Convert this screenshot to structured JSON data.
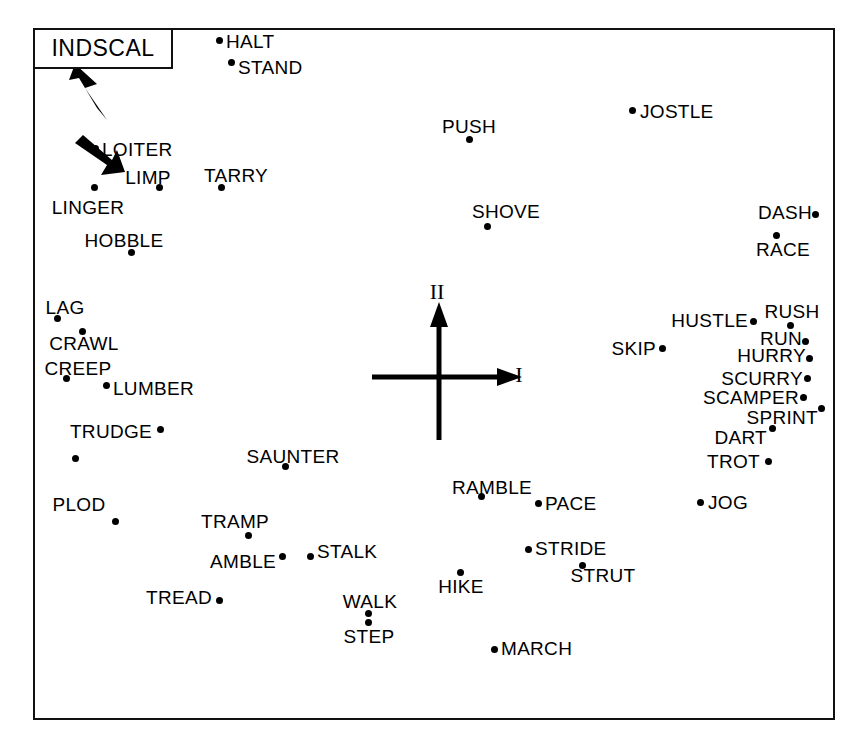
{
  "figure": {
    "method_label": "INDSCAL",
    "frame": {
      "x": 33,
      "y": 28,
      "width": 802,
      "height": 692
    },
    "title_box": {
      "x": 33,
      "y": 28,
      "width": 140,
      "height": 41
    }
  },
  "axes": {
    "origin": {
      "x": 437,
      "y": 375
    },
    "dimension_1_label": "I",
    "dimension_2_label": "II",
    "dimension_1_label_pos": {
      "x": 519,
      "y": 375
    },
    "dimension_2_label_pos": {
      "x": 437,
      "y": 292
    },
    "horizontal": {
      "x1": 370,
      "y1": 375,
      "x2": 508,
      "y2": 375
    },
    "vertical": {
      "x1": 437,
      "y1": 438,
      "x2": 437,
      "y2": 305
    }
  },
  "chart_data": {
    "type": "scatter",
    "title": "INDSCAL",
    "xlabel": "I",
    "ylabel": "II",
    "grid": false,
    "legend": null,
    "note": "Two-dimensional INDSCAL configuration of 41 English locomotion verbs. Coordinates given in screenshot pixel space; axis origin at (437, 375).",
    "points": [
      {
        "label": "HALT",
        "x": 219,
        "y": 40,
        "label_anchor": "left",
        "label_x": 226,
        "label_y": 41
      },
      {
        "label": "STAND",
        "x": 231,
        "y": 62,
        "label_anchor": "left",
        "label_x": 238,
        "label_y": 67
      },
      {
        "label": "JOSTLE",
        "x": 632,
        "y": 110,
        "label_anchor": "left",
        "label_x": 640,
        "label_y": 111
      },
      {
        "label": "PUSH",
        "x": 469,
        "y": 139,
        "label_anchor": "center",
        "label_x": 469,
        "label_y": 126
      },
      {
        "label": "LOITER",
        "x": 95,
        "y": 148,
        "label_anchor": "left",
        "label_x": 102,
        "label_y": 149
      },
      {
        "label": "LIMP",
        "x": 159,
        "y": 187,
        "label_anchor": "center",
        "label_x": 148,
        "label_y": 177
      },
      {
        "label": "TARRY",
        "x": 221,
        "y": 187,
        "label_anchor": "center",
        "label_x": 236,
        "label_y": 175
      },
      {
        "label": "LINGER",
        "x": 94,
        "y": 187,
        "label_anchor": "center",
        "label_x": 88,
        "label_y": 207
      },
      {
        "label": "DASH",
        "x": 815,
        "y": 214,
        "label_anchor": "right",
        "label_x": 812,
        "label_y": 212
      },
      {
        "label": "SHOVE",
        "x": 487,
        "y": 226,
        "label_anchor": "center",
        "label_x": 506,
        "label_y": 211
      },
      {
        "label": "RACE",
        "x": 776,
        "y": 235,
        "label_anchor": "center",
        "label_x": 783,
        "label_y": 249
      },
      {
        "label": "HOBBLE",
        "x": 131,
        "y": 252,
        "label_anchor": "center",
        "label_x": 124,
        "label_y": 240
      },
      {
        "label": "LAG",
        "x": 57,
        "y": 318,
        "label_anchor": "center",
        "label_x": 65,
        "label_y": 307
      },
      {
        "label": "CRAWL",
        "x": 82,
        "y": 331,
        "label_anchor": "center",
        "label_x": 84,
        "label_y": 343
      },
      {
        "label": "RUSH",
        "x": 790,
        "y": 325,
        "label_anchor": "center",
        "label_x": 792,
        "label_y": 311
      },
      {
        "label": "HUSTLE",
        "x": 753,
        "y": 321,
        "label_anchor": "right",
        "label_x": 748,
        "label_y": 320
      },
      {
        "label": "RUN",
        "x": 805,
        "y": 341,
        "label_anchor": "right",
        "label_x": 802,
        "label_y": 338
      },
      {
        "label": "SKIP",
        "x": 662,
        "y": 348,
        "label_anchor": "right",
        "label_x": 656,
        "label_y": 348
      },
      {
        "label": "HURRY",
        "x": 809,
        "y": 358,
        "label_anchor": "right",
        "label_x": 806,
        "label_y": 355
      },
      {
        "label": "CREEP",
        "x": 66,
        "y": 378,
        "label_anchor": "center",
        "label_x": 78,
        "label_y": 368
      },
      {
        "label": "SCURRY",
        "x": 807,
        "y": 378,
        "label_anchor": "right",
        "label_x": 803,
        "label_y": 378
      },
      {
        "label": "LUMBER",
        "x": 106,
        "y": 385,
        "label_anchor": "left",
        "label_x": 113,
        "label_y": 388
      },
      {
        "label": "SCAMPER",
        "x": 803,
        "y": 397,
        "label_anchor": "right",
        "label_x": 799,
        "label_y": 397
      },
      {
        "label": "SPRINT",
        "x": 821,
        "y": 408,
        "label_anchor": "right",
        "label_x": 818,
        "label_y": 417
      },
      {
        "label": "TRUDGE",
        "x": 160,
        "y": 429,
        "label_anchor": "right",
        "label_x": 152,
        "label_y": 431
      },
      {
        "label": "DART",
        "x": 772,
        "y": 428,
        "label_anchor": "right",
        "label_x": 767,
        "label_y": 437
      },
      {
        "label": "SAUNTER",
        "x": 285,
        "y": 466,
        "label_anchor": "center",
        "label_x": 293,
        "label_y": 456
      },
      {
        "label": "TROT",
        "x": 768,
        "y": 461,
        "label_anchor": "right",
        "label_x": 760,
        "label_y": 461
      },
      {
        "label": "RAMBLE",
        "x": 481,
        "y": 496,
        "label_anchor": "center",
        "label_x": 492,
        "label_y": 487
      },
      {
        "label": "PACE",
        "x": 538,
        "y": 503,
        "label_anchor": "left",
        "label_x": 545,
        "label_y": 503
      },
      {
        "label": "JOG",
        "x": 700,
        "y": 502,
        "label_anchor": "left",
        "label_x": 708,
        "label_y": 502
      },
      {
        "label": "TRAMP",
        "x": 248,
        "y": 535,
        "label_anchor": "center",
        "label_x": 235,
        "label_y": 521
      },
      {
        "label": "STALK",
        "x": 310,
        "y": 556,
        "label_anchor": "left",
        "label_x": 317,
        "label_y": 551
      },
      {
        "label": "AMBLE",
        "x": 282,
        "y": 556,
        "label_anchor": "right",
        "label_x": 276,
        "label_y": 561
      },
      {
        "label": "STRIDE",
        "x": 528,
        "y": 549,
        "label_anchor": "left",
        "label_x": 535,
        "label_y": 548
      },
      {
        "label": "STRUT",
        "x": 582,
        "y": 565,
        "label_anchor": "center",
        "label_x": 603,
        "label_y": 575
      },
      {
        "label": "HIKE",
        "x": 460,
        "y": 572,
        "label_anchor": "center",
        "label_x": 461,
        "label_y": 586
      },
      {
        "label": "TREAD",
        "x": 219,
        "y": 600,
        "label_anchor": "right",
        "label_x": 212,
        "label_y": 597
      },
      {
        "label": "WALK",
        "x": 368,
        "y": 613,
        "label_anchor": "center",
        "label_x": 370,
        "label_y": 601
      },
      {
        "label": "STEP",
        "x": 368,
        "y": 622,
        "label_anchor": "center",
        "label_x": 369,
        "label_y": 636
      },
      {
        "label": "MARCH",
        "x": 494,
        "y": 649,
        "label_anchor": "left",
        "label_x": 501,
        "label_y": 648
      }
    ],
    "annotated_points": [
      {
        "label": "PLOD",
        "label_anchor": "center",
        "label_x": 79,
        "label_y": 504,
        "targets": [
          {
            "x": 75,
            "y": 458
          },
          {
            "x": 115,
            "y": 521
          }
        ]
      }
    ]
  }
}
